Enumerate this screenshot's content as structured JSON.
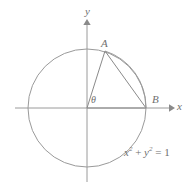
{
  "figure": {
    "type": "unit-circle-geometry-diagram",
    "background_color": "#ffffff",
    "stroke_color": "#8f8f8f",
    "text_color": "#6f6f6f",
    "axes": {
      "x_axis_label": "x",
      "y_axis_label": "y",
      "x_axis_start_px": 15,
      "x_axis_end_px": 172,
      "y_axis_top_px": 22,
      "y_axis_bottom_px": 182,
      "origin_px": {
        "x": 87,
        "y": 108
      },
      "arrows": [
        "x-positive",
        "y-positive"
      ]
    },
    "circle": {
      "center_px": {
        "x": 87,
        "y": 108
      },
      "radius_px": 59,
      "equation_text": "x2 + y2 = 1",
      "equation_parts": {
        "x_var": "x",
        "x_exp": "2",
        "plus": " + ",
        "y_var": "y",
        "y_exp": "2",
        "equals": " = ",
        "value": "1"
      }
    },
    "points": [
      {
        "id": "A",
        "label": "A",
        "px": {
          "x": 105,
          "y": 51
        },
        "on_circle": true
      },
      {
        "id": "B",
        "label": "B",
        "px": {
          "x": 146,
          "y": 108
        },
        "on_circle": true
      }
    ],
    "angle": {
      "symbol": "θ",
      "vertex": "origin",
      "from_ray": "positive-x-axis",
      "to_ray": "origin-to-A"
    },
    "segments": [
      {
        "name": "origin-to-A",
        "from": "origin",
        "to": "A"
      },
      {
        "name": "origin-to-B",
        "from": "origin",
        "to": "B"
      },
      {
        "name": "chord-A-to-B",
        "from": "A",
        "to": "B"
      }
    ],
    "arc": {
      "name": "arc-A-to-B",
      "from": "A",
      "to": "B",
      "along": "circle"
    }
  }
}
